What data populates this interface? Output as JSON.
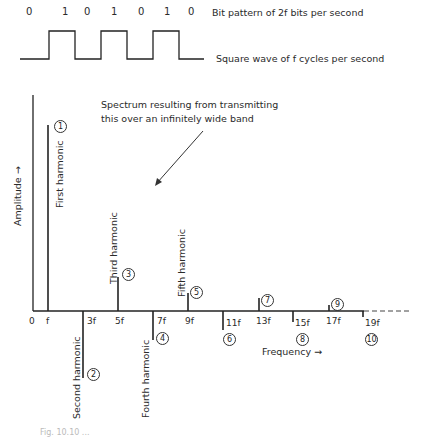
{
  "top": {
    "bits": [
      "0",
      "1",
      "0",
      "1",
      "0",
      "1",
      "0"
    ],
    "bit_pattern_label": "Bit pattern of 2f bits per second",
    "square_wave_label": "Square wave of f cycles per second"
  },
  "annotation": {
    "line1": "Spectrum resulting from transmitting",
    "line2": "this over an infinitely wide band"
  },
  "axes": {
    "ylabel": "Amplitude →",
    "xlabel": "Frequency →",
    "origin": "0"
  },
  "harmonic_names": {
    "1": "First harmonic",
    "2": "Second harmonic",
    "3": "Third harmonic",
    "4": "Fourth harmonic",
    "5": "Fifth harmonic"
  },
  "ticks": [
    "f",
    "3f",
    "5f",
    "7f",
    "9f",
    "11f",
    "13f",
    "15f",
    "17f",
    "19f"
  ],
  "markers": [
    "1",
    "2",
    "3",
    "4",
    "5",
    "6",
    "7",
    "8",
    "9",
    "10"
  ],
  "caption": "Fig. 10.10 ..."
}
